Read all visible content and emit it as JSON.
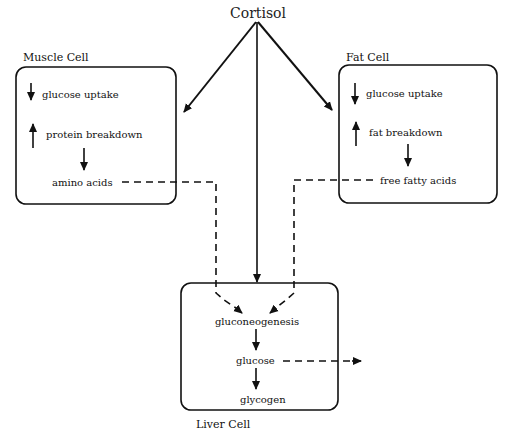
{
  "diagram": {
    "source": "Cortisol",
    "muscle_cell": {
      "title": "Muscle Cell",
      "items": [
        "glucose uptake",
        "protein breakdown",
        "amino acids"
      ],
      "item_directions": [
        "down",
        "up",
        ""
      ]
    },
    "fat_cell": {
      "title": "Fat Cell",
      "items": [
        "glucose uptake",
        "fat breakdown",
        "free fatty acids"
      ],
      "item_directions": [
        "down",
        "up",
        ""
      ]
    },
    "liver_cell": {
      "title": "Liver Cell",
      "items": [
        "gluconeogenesis",
        "glucose",
        "glycogen"
      ]
    },
    "edges": [
      {
        "from": "Cortisol",
        "to": "Muscle Cell",
        "style": "solid"
      },
      {
        "from": "Cortisol",
        "to": "Fat Cell",
        "style": "solid"
      },
      {
        "from": "Cortisol",
        "to": "Liver Cell",
        "style": "solid"
      },
      {
        "from": "amino acids",
        "to": "gluconeogenesis",
        "style": "dashed"
      },
      {
        "from": "free fatty acids",
        "to": "gluconeogenesis",
        "style": "dashed"
      },
      {
        "from": "gluconeogenesis",
        "to": "glucose",
        "style": "solid"
      },
      {
        "from": "glucose",
        "to": "glycogen",
        "style": "solid"
      },
      {
        "from": "glucose",
        "to": "out",
        "style": "dashed"
      }
    ]
  }
}
